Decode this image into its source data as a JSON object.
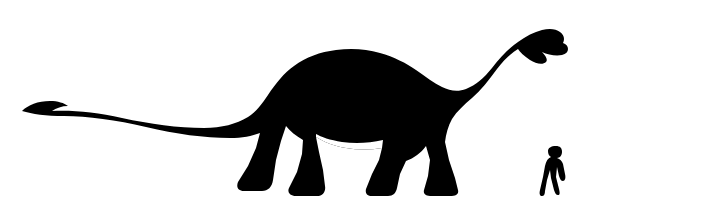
{
  "figure": {
    "kind": "size-comparison-silhouette-diagram",
    "background_color": "#ffffff",
    "silhouette_color": "#000000",
    "frame_color": "#b6b6b6",
    "frame_shadow_color": "#c8c8c8",
    "canvas": {
      "width": 707,
      "height": 213
    },
    "ground_line_y": 196
  },
  "subjects": [
    {
      "name": "sauropod-dinosaur",
      "label": "sauropod dinosaur silhouette",
      "facing": "right",
      "pose": "walking",
      "features": [
        "long tapering tail held low with upturned tip",
        "deep barrel-shaped body",
        "four columnar legs",
        "long upward-sweeping neck",
        "small head with open mouth"
      ],
      "bounds": {
        "x": 18,
        "y": 28,
        "width": 524,
        "height": 168
      }
    },
    {
      "name": "human",
      "label": "human silhouette for scale",
      "facing": "left",
      "pose": "walking",
      "bounds": {
        "x": 545,
        "y": 146,
        "width": 24,
        "height": 50
      }
    }
  ],
  "shapes": {
    "dinosaur_path": "M 22 111 C 28 105, 38 101, 50 101 C 58 101, 64 103, 68 106 C 62 106, 56 108, 52 111 C 72 110, 96 112, 122 118 C 150 124, 178 128, 204 128 C 222 128, 236 124, 248 117 C 256 112, 262 104, 268 95 C 276 83, 284 73, 294 66 C 306 57, 320 52, 336 50 C 352 48, 366 49, 380 53 C 394 57, 406 63, 416 70 C 426 77, 434 83, 442 87 C 450 91, 458 92, 466 89 C 476 85, 484 78, 492 68 C 500 58, 508 49, 518 42 C 526 36, 534 32, 542 30 C 550 28, 556 29, 560 32 C 564 35, 565 39, 563 43 C 566 44, 568 46, 568 49 C 568 52, 566 54, 562 55 C 556 56, 548 55, 542 52 C 546 56, 548 60, 546 62 C 543 65, 536 64, 530 60 C 524 56, 520 52, 518 49 C 510 54, 503 61, 497 69 C 489 80, 481 90, 472 98 C 464 105, 457 111, 452 119 C 448 126, 446 134, 445 142 L 449 160 L 455 178 L 458 190 C 459 194, 456 196, 450 196 L 432 196 C 426 196, 423 194, 424 190 L 428 176 L 430 160 L 426 146 C 421 153, 414 158, 406 161 L 400 174 L 397 188 C 396 193, 393 196, 388 196 L 372 196 C 367 196, 365 193, 366 189 L 372 174 L 379 160 L 382 148 C 370 150, 358 150, 346 148 C 334 146, 324 142, 316 137 L 319 152 L 323 170 L 325 186 C 326 191, 323 196, 317 196 L 296 196 C 290 196, 287 192, 289 188 L 297 172 L 302 154 L 303 140 C 296 136, 290 131, 286 126 L 281 141 L 276 160 L 273 180 C 272 187, 268 191, 262 191 L 244 191 C 238 191, 236 187, 238 182 L 248 166 L 256 148 L 260 133 C 252 136, 242 138, 230 138 C 204 138, 176 134, 146 127 C 116 120, 88 116, 64 116 C 46 116, 32 114, 22 111 Z",
    "dinosaur_belly_notch": "M 316 137 C 324 142, 334 146, 346 148 C 358 150, 370 150, 382 148 L 383 140 C 370 143, 356 144, 342 142 C 330 140, 321 137, 316 134 Z",
    "human_path": "M 556 146 C 560 146, 562 148, 562 152 C 562 155, 560 158, 557 158 C 560 159, 562 161, 563 164 L 565 174 C 566 178, 565 181, 563 181 C 561 181, 560 179, 559 176 L 557 167 L 556 177 L 559 189 C 560 193, 560 195, 558 195 C 556 195, 555 193, 554 190 L 551 178 L 550 170 L 547 180 L 545 191 C 545 194, 544 196, 542 196 C 540 196, 539 194, 540 190 L 543 177 L 545 166 C 546 161, 548 158, 551 157 C 549 156, 548 154, 548 151 C 548 148, 551 146, 556 146 Z"
  }
}
